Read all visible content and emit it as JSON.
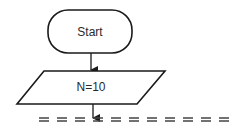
{
  "diagram": {
    "type": "flowchart",
    "nodes": [
      {
        "id": "start",
        "shape": "terminal",
        "label": "Start"
      },
      {
        "id": "input",
        "shape": "parallelogram",
        "label": "N=10"
      }
    ],
    "edges": [
      {
        "from": "start",
        "to": "input"
      },
      {
        "from": "input",
        "to": "continuation"
      }
    ],
    "continuation": "dashed-break-line"
  },
  "colors": {
    "stroke": "#1a1a1a",
    "background": "#ffffff",
    "text": "#2a2a2a"
  }
}
